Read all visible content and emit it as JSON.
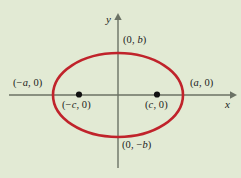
{
  "figure": {
    "background_color": "#e2ead4",
    "curve_color": "#c0232b",
    "axis_color": "#5b6257",
    "point_color": "#000000",
    "axes": {
      "x_label": "x",
      "y_label": "y",
      "origin": [
        118,
        95
      ]
    },
    "labels": {
      "top_vertex": "(0, b)",
      "bottom_vertex": "(0, −b)",
      "left_vertex": "(−a, 0)",
      "right_vertex": "(a, 0)",
      "left_focus": "(−c, 0)",
      "right_focus": "(c, 0)"
    }
  },
  "chart_data": {
    "type": "scatter",
    "xlabel": "x",
    "ylabel": "y",
    "curve": {
      "name": "ellipse",
      "equation": "x^2/a^2 + y^2/b^2 = 1",
      "center": [
        0,
        0
      ],
      "semi_major_axis_px": 65,
      "semi_minor_axis_px": 42
    },
    "annotations": [
      {
        "label": "(0, b)",
        "role": "co-vertex",
        "px": [
          118,
          53
        ]
      },
      {
        "label": "(0, −b)",
        "role": "co-vertex",
        "px": [
          118,
          137
        ]
      },
      {
        "label": "(−a, 0)",
        "role": "vertex",
        "px": [
          53,
          95
        ]
      },
      {
        "label": "(a, 0)",
        "role": "vertex",
        "px": [
          183,
          95
        ]
      },
      {
        "label": "(−c, 0)",
        "role": "focus",
        "px": [
          79,
          95
        ]
      },
      {
        "label": "(c, 0)",
        "role": "focus",
        "px": [
          157,
          95
        ]
      }
    ],
    "grid": false,
    "legend": null
  }
}
